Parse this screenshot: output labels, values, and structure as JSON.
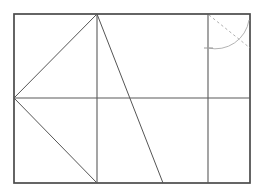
{
  "figure": {
    "canvas": {
      "width": 261,
      "height": 195
    },
    "background_color": "#ffffff",
    "colors": {
      "frame": "#4a4a4a",
      "inner_line": "#5a5a5a",
      "diagonal": "#555555",
      "construction": "#b3b3b3"
    },
    "rectangle": {
      "label": "outer-rectangle",
      "left": 14,
      "top": 14,
      "right": 250,
      "bottom": 183,
      "width": 236,
      "height": 169
    },
    "points": {
      "top_left": {
        "x": 14,
        "y": 14
      },
      "top_right": {
        "x": 250,
        "y": 14
      },
      "bottom_left": {
        "x": 14,
        "y": 183
      },
      "bottom_right": {
        "x": 250,
        "y": 183
      },
      "left_mid": {
        "x": 14,
        "y": 98
      },
      "right_mid": {
        "x": 250,
        "y": 98
      },
      "apex_top": {
        "x": 97,
        "y": 14
      },
      "foot_bottom": {
        "x": 97,
        "y": 183
      },
      "diagonal_foot": {
        "x": 163,
        "y": 183
      },
      "divider_top": {
        "x": 208,
        "y": 14
      },
      "divider_bottom": {
        "x": 208,
        "y": 183
      },
      "divider_mid": {
        "x": 208,
        "y": 98
      },
      "arc_start": {
        "x": 208,
        "y": 48
      },
      "arc_end": {
        "x": 249,
        "y": 20
      }
    },
    "segments": [
      {
        "name": "horizontal-midline",
        "x1": 14,
        "y1": 98,
        "x2": 250,
        "y2": 98,
        "style": "inner"
      },
      {
        "name": "vertical-median",
        "x1": 97,
        "y1": 14,
        "x2": 97,
        "y2": 183,
        "style": "inner"
      },
      {
        "name": "vertical-right-divider",
        "x1": 208,
        "y1": 14,
        "x2": 208,
        "y2": 183,
        "style": "inner"
      },
      {
        "name": "diagonal-upper-left",
        "x1": 14,
        "y1": 98,
        "x2": 97,
        "y2": 14,
        "style": "diagonal"
      },
      {
        "name": "diagonal-lower-left",
        "x1": 14,
        "y1": 98,
        "x2": 97,
        "y2": 183,
        "style": "diagonal"
      },
      {
        "name": "diagonal-apex-to-bottom",
        "x1": 97,
        "y1": 14,
        "x2": 163,
        "y2": 183,
        "style": "diagonal"
      }
    ],
    "construction": {
      "arc": {
        "name": "quarter-arc",
        "center_x": 208,
        "center_y": 14,
        "radius": 34,
        "start": {
          "x": 208,
          "y": 48
        },
        "end": {
          "x": 249,
          "y": 20
        },
        "style": "solid-light"
      },
      "dashed_line": {
        "name": "dashed-diagonal",
        "x1": 209,
        "y1": 15,
        "x2": 250,
        "y2": 48,
        "style": "dashed"
      },
      "tick": {
        "name": "arc-base-tick",
        "x1": 204,
        "y1": 48,
        "x2": 213,
        "y2": 48
      }
    }
  }
}
